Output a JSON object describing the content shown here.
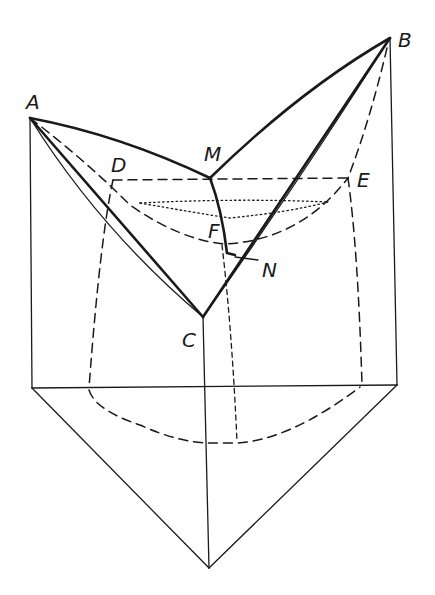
{
  "figure": {
    "stroke_color": "#1a1a1a",
    "background": "#ffffff"
  },
  "labels": {
    "A": "A",
    "B": "B",
    "M": "M",
    "D": "D",
    "E": "E",
    "F": "F",
    "N": "N",
    "C": "C"
  }
}
